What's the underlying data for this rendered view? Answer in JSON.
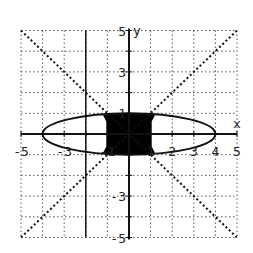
{
  "chart_data": {
    "type": "line",
    "title": "",
    "xlabel": "x",
    "ylabel": "y",
    "xlim": [
      -5,
      5
    ],
    "ylim": [
      -5,
      5
    ],
    "grid": true,
    "x_ticks": [
      "-5",
      "-3",
      "-1",
      "1",
      "2",
      "3",
      "4",
      "5"
    ],
    "y_ticks": [
      "5",
      "3",
      "1",
      "-1",
      "-3",
      "-5"
    ],
    "series": [
      {
        "name": "ellipse",
        "style": "solid",
        "equation": "x^2/16 + y^2 = 1",
        "x_extent": [
          -4,
          4
        ],
        "y_extent": [
          -1,
          1
        ]
      },
      {
        "name": "line y = x",
        "style": "dotted",
        "points": [
          [
            -5,
            -5
          ],
          [
            5,
            5
          ]
        ]
      },
      {
        "name": "line y = -x",
        "style": "dotted",
        "points": [
          [
            -5,
            5
          ],
          [
            5,
            -5
          ]
        ]
      }
    ],
    "shaded_region": {
      "description": "region inside ellipse between the diagonal lines, |y| >= |x|",
      "x_extent": [
        -1.2,
        1.2
      ],
      "y_extent": [
        -1,
        1
      ],
      "color": "#000000"
    }
  },
  "labels": {
    "x_axis": "x",
    "y_axis": "y",
    "x_tick_labels": [
      {
        "text": "-5",
        "value": -5
      },
      {
        "text": "-3",
        "value": -3
      },
      {
        "text": "-1",
        "value": -1
      },
      {
        "text": "1",
        "value": 1
      },
      {
        "text": "2",
        "value": 2
      },
      {
        "text": "3",
        "value": 3
      },
      {
        "text": "4",
        "value": 4
      },
      {
        "text": "5",
        "value": 5
      }
    ],
    "y_tick_labels": [
      {
        "text": "5",
        "value": 5
      },
      {
        "text": "3",
        "value": 3
      },
      {
        "text": "1",
        "value": 1
      },
      {
        "text": "-3",
        "value": -3
      },
      {
        "text": "-5",
        "value": -5
      }
    ]
  },
  "colors": {
    "ink": "#111111",
    "grid": "#555555",
    "background": "#ffffff"
  }
}
